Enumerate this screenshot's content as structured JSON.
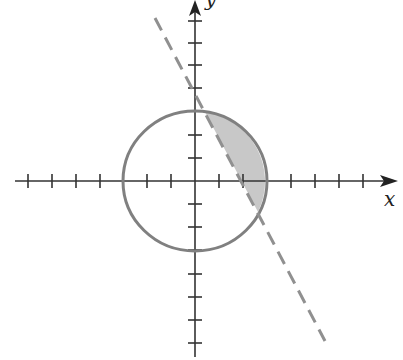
{
  "figure": {
    "axes": {
      "x_label": "x",
      "y_label": "y",
      "x_ticks": [
        -7,
        -6,
        -5,
        -4,
        -3,
        -2,
        -1,
        1,
        2,
        3,
        4,
        5,
        6,
        7
      ],
      "y_ticks": [
        -7,
        -6,
        -5,
        -4,
        -3,
        -2,
        -1,
        1,
        2,
        3,
        4,
        5,
        6,
        7
      ]
    },
    "circle": {
      "center": [
        0,
        0
      ],
      "radius": 3,
      "stroke": "#808080"
    },
    "line": {
      "style": "dashed",
      "stroke": "#909090",
      "passes_through": [
        [
          0.4,
          3
        ],
        [
          2.6,
          -1.3
        ]
      ]
    },
    "shaded_region": {
      "fill": "#c8c8c8",
      "bounded_by": [
        "circle arc (right)",
        "dashed line"
      ]
    },
    "colors": {
      "axis": "#333333",
      "circle": "#808080",
      "line": "#909090",
      "shade": "#c8c8c8"
    }
  }
}
